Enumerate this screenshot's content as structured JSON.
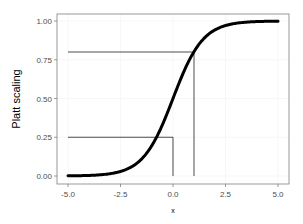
{
  "chart_data": {
    "type": "line",
    "title": "",
    "xlabel": "x",
    "ylabel": "Platt scaling",
    "xlim": [
      -5.0,
      5.0
    ],
    "ylim": [
      0.0,
      1.0
    ],
    "x_ticks": [
      "-5.0",
      "-2.5",
      "0.0",
      "2.5",
      "5.0"
    ],
    "y_ticks": [
      "0.00",
      "0.25",
      "0.50",
      "0.75",
      "1.00"
    ],
    "grid": true,
    "legend": null,
    "series": [
      {
        "name": "sigmoid",
        "function": "1 / (1 + exp(-1.4*x))",
        "x": [
          -5.0,
          -4.0,
          -3.0,
          -2.0,
          -1.5,
          -1.0,
          -0.5,
          0.0,
          0.5,
          1.0,
          1.5,
          2.0,
          3.0,
          4.0,
          5.0
        ],
        "y": [
          0.0,
          0.0,
          0.01,
          0.06,
          0.11,
          0.2,
          0.33,
          0.5,
          0.67,
          0.8,
          0.89,
          0.94,
          0.99,
          1.0,
          1.0
        ]
      }
    ],
    "annotations": [
      {
        "type": "hline",
        "y": 0.8,
        "x_from": -5.0,
        "x_to": 1.0
      },
      {
        "type": "vline",
        "x": 1.0,
        "y_from": 0.0,
        "y_to": 0.8
      },
      {
        "type": "hline",
        "y": 0.25,
        "x_from": -5.0,
        "x_to": 0.0
      },
      {
        "type": "vline",
        "x": 0.0,
        "y_from": 0.0,
        "y_to": 0.25
      }
    ]
  }
}
